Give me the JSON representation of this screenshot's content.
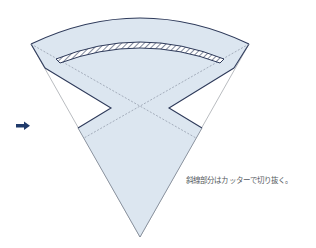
{
  "diagram": {
    "top_label": "",
    "note": "斜線部分はカッターで切り抜く。",
    "colors": {
      "fill": "#dce6f0",
      "outline": "#2e3a5a",
      "cut_line": "#8a8f96",
      "dashed": "#8b93a3",
      "arrow": "#1f3a6b"
    },
    "shape": "fan-shaped paper template with two side notches, a hatched arc cut-out slot, and dashed fold lines crossing in an X",
    "arrow_direction": "right"
  }
}
